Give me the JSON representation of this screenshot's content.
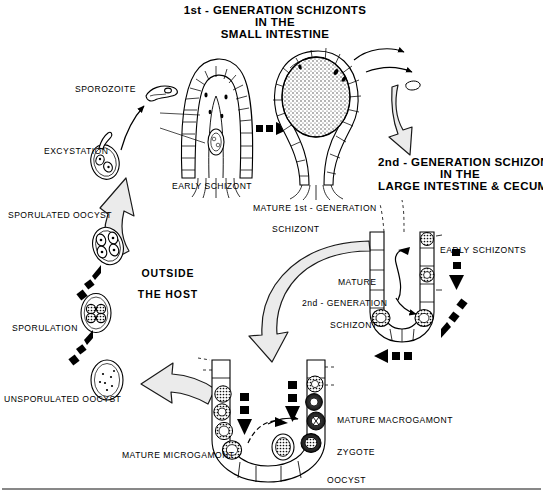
{
  "diagram": {
    "background": "#ffffff",
    "ink": "#000000",
    "arrow_fill": "#ebebeb",
    "arrow_stroke": "#1a1a1a"
  },
  "headings": {
    "first_generation": {
      "line1": "1st - GENERATION SCHIZONTS",
      "line2": "IN THE",
      "line3": "SMALL  INTESTINE"
    },
    "second_generation": {
      "line1": "2nd - GENERATION SCHIZONTS",
      "line2": "IN  THE",
      "line3": "LARGE  INTESTINE  &  CECUM"
    },
    "outside_host": {
      "line1": "OUTSIDE",
      "line2": "THE  HOST"
    }
  },
  "labels": {
    "sporozoite": "SPOROZOITE",
    "excystation": "EXCYSTATION",
    "sporulated_oocyst": "SPORULATED OOCYST",
    "sporulation": "SPORULATION",
    "unsporulated_oocyst": "UNSPORULATED OOCYST",
    "early_schizont": "EARLY SCHIZONT",
    "mature_first_gen_l1": "MATURE 1st - GENERATION",
    "mature_first_gen_l2": "SCHIZONT",
    "early_schizonts": "EARLY SCHIZONTS",
    "mature_second_gen_l1": "MATURE",
    "mature_second_gen_l2": "2nd - GENERATION",
    "mature_second_gen_l3": "SCHIZONT",
    "mature_macrogamont": "MATURE MACROGAMONT",
    "mature_microgamont": "MATURE MICROGAMONT",
    "zygote": "ZYGOTE",
    "oocyst": "OOCYST"
  },
  "stages": [
    {
      "name": "sporozoite",
      "note": "banana-shaped sporozoite, free in lumen"
    },
    {
      "name": "excystation",
      "note": "sporozoite emerging from sporulated oocyst"
    },
    {
      "name": "sporulated-oocyst",
      "note": "oocyst with four sporocysts"
    },
    {
      "name": "sporulation",
      "note": "oocyst with sporulating mass"
    },
    {
      "name": "unsporulated-oocyst",
      "note": "oocyst with granular zygote"
    },
    {
      "name": "early-schizont-villus",
      "note": "small intestinal villus with early schizont"
    },
    {
      "name": "mature-first-generation-schizont-villus",
      "note": "distended villus filled with mature schizont"
    },
    {
      "name": "early-schizonts-crypt",
      "note": "large intestinal crypt with early schizonts"
    },
    {
      "name": "mature-second-generation-schizont-crypt",
      "note": "crypt with mature 2nd generation schizont"
    },
    {
      "name": "gamogony-crypt",
      "note": "crypt with micro/macrogamonts, zygote, oocyst"
    }
  ],
  "flow": {
    "block_arrows": [
      "oocyst-to-excystation",
      "schizont1-to-schizont2",
      "schizont2-to-gamogony",
      "gamogony-to-oocyst"
    ],
    "dashed_arrows": [
      "sporozoite-to-villus",
      "villus-to-villus",
      "crypt-to-crypt",
      "crypt-to-gamogony",
      "oocyst-to-sporulation",
      "sporulation-to-sporulated"
    ]
  }
}
